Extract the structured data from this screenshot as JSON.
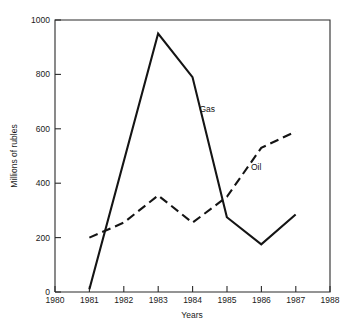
{
  "chart_data": {
    "type": "line",
    "title": "",
    "xlabel": "Years",
    "ylabel": "Millions of rubles",
    "xlim": [
      1980,
      1988
    ],
    "ylim": [
      0,
      1000
    ],
    "xticks": [
      "1980",
      "1981",
      "1982",
      "1983",
      "1984",
      "1985",
      "1986",
      "1987",
      "1988"
    ],
    "yticks": [
      "0",
      "200",
      "400",
      "600",
      "800",
      "1000"
    ],
    "grid": false,
    "legend_position": "inline-annotations",
    "series": [
      {
        "name": "Gas",
        "style": "solid",
        "color": "#141414",
        "x": [
          1981,
          1983,
          1984,
          1985,
          1986,
          1987
        ],
        "values": [
          10,
          950,
          790,
          275,
          175,
          285
        ]
      },
      {
        "name": "Oil",
        "style": "dashed",
        "color": "#141414",
        "x": [
          1981,
          1982,
          1983,
          1984,
          1985,
          1986,
          1987
        ],
        "values": [
          200,
          255,
          355,
          255,
          350,
          530,
          590
        ]
      }
    ],
    "annotations": [
      {
        "text": "Gas",
        "x": 1984.2,
        "y": 660
      },
      {
        "text": "Oil",
        "x": 1985.7,
        "y": 450
      }
    ]
  },
  "caption": {
    "clipped_text": ""
  }
}
